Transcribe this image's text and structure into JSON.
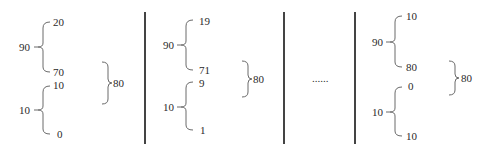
{
  "diagram": {
    "panels": [
      {
        "id": "panel-1",
        "upper_group": {
          "label": "90",
          "top": "20",
          "bottom": "70"
        },
        "lower_group": {
          "label": "10",
          "top": "10",
          "bottom": "0"
        },
        "outer_group": {
          "label": "80"
        }
      },
      {
        "id": "panel-2",
        "upper_group": {
          "label": "90",
          "top": "19",
          "bottom": "71"
        },
        "lower_group": {
          "label": "10",
          "top": "9",
          "bottom": "1"
        },
        "outer_group": {
          "label": "80"
        }
      },
      {
        "id": "panel-ellipsis",
        "ellipsis": "......"
      },
      {
        "id": "panel-3",
        "upper_group": {
          "label": "90",
          "top": "10",
          "bottom": "80"
        },
        "lower_group": {
          "label": "10",
          "top": "0",
          "bottom": "10"
        },
        "outer_group": {
          "label": "80"
        }
      }
    ],
    "colors": {
      "line": "#444444",
      "brace": "#6a6a6a",
      "text": "#2a2a2a"
    }
  }
}
